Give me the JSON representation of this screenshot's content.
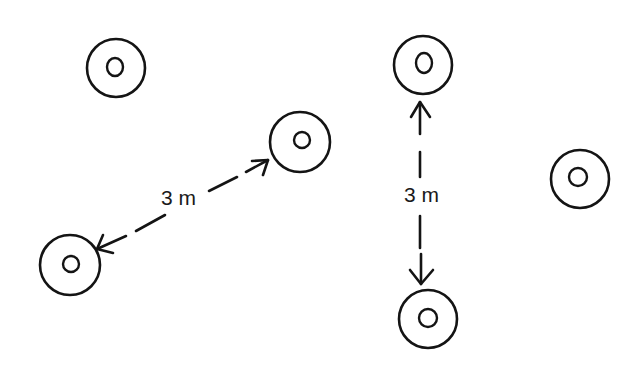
{
  "diagram": {
    "stroke_color": "#141414",
    "background": "#ffffff",
    "objects": [
      {
        "id": "ring-1",
        "cx": 116,
        "cy": 68,
        "r_outer": 29,
        "r_inner": 8
      },
      {
        "id": "ring-2",
        "cx": 300,
        "cy": 142,
        "r_outer": 30,
        "r_inner": 8
      },
      {
        "id": "ring-3",
        "cx": 70,
        "cy": 265,
        "r_outer": 30,
        "r_inner": 8
      },
      {
        "id": "ring-4",
        "cx": 423,
        "cy": 65,
        "r_outer": 29,
        "r_inner": 9
      },
      {
        "id": "ring-5",
        "cx": 428,
        "cy": 319,
        "r_outer": 29,
        "r_inner": 9
      },
      {
        "id": "ring-6",
        "cx": 580,
        "cy": 179,
        "r_outer": 29,
        "r_inner": 8
      }
    ],
    "measurements": [
      {
        "id": "diagonal",
        "from": "ring-3",
        "to": "ring-2",
        "label": "3 m",
        "label_x": 161,
        "label_y": 205
      },
      {
        "id": "vertical",
        "from": "ring-4",
        "to": "ring-5",
        "label": "3 m",
        "label_x": 404,
        "label_y": 202
      }
    ]
  }
}
